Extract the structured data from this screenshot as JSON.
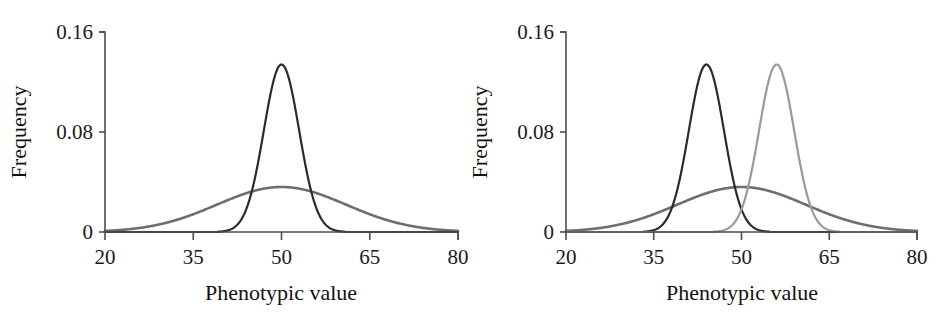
{
  "figure": {
    "background": "#ffffff",
    "panel_count": 2
  },
  "chart_data": [
    {
      "panel": "left",
      "type": "line",
      "title": "",
      "xlabel": "Phenotypic value",
      "ylabel": "Frequency",
      "xlim": [
        20,
        80
      ],
      "ylim": [
        0,
        0.16
      ],
      "xticks": [
        20,
        35,
        50,
        65,
        80
      ],
      "xticklabels": [
        "20",
        "35",
        "50",
        "65",
        "80"
      ],
      "yticks": [
        0,
        0.08,
        0.16
      ],
      "yticklabels": [
        "0",
        "0.08",
        "0.16"
      ],
      "grid": false,
      "legend": "none",
      "series": [
        {
          "name": "broad-distribution",
          "color": "#6e6e6e",
          "linewidth": 2.6,
          "shape": "gaussian",
          "mean": 50,
          "sd": 11.0,
          "peak": 0.036
        },
        {
          "name": "narrow-distribution",
          "color": "#2b2b2b",
          "linewidth": 2.2,
          "shape": "gaussian",
          "mean": 50,
          "sd": 3.0,
          "peak": 0.134
        }
      ]
    },
    {
      "panel": "right",
      "type": "line",
      "title": "",
      "xlabel": "Phenotypic value",
      "ylabel": "Frequency",
      "xlim": [
        20,
        80
      ],
      "ylim": [
        0,
        0.16
      ],
      "xticks": [
        20,
        35,
        50,
        65,
        80
      ],
      "xticklabels": [
        "20",
        "35",
        "50",
        "65",
        "80"
      ],
      "yticks": [
        0,
        0.08,
        0.16
      ],
      "yticklabels": [
        "0",
        "0.08",
        "0.16"
      ],
      "grid": false,
      "legend": "none",
      "series": [
        {
          "name": "broad-distribution",
          "color": "#6e6e6e",
          "linewidth": 2.6,
          "shape": "gaussian",
          "mean": 50,
          "sd": 11.0,
          "peak": 0.036
        },
        {
          "name": "narrow-distribution-low",
          "color": "#2b2b2b",
          "linewidth": 2.2,
          "shape": "gaussian",
          "mean": 44,
          "sd": 3.0,
          "peak": 0.134
        },
        {
          "name": "narrow-distribution-high",
          "color": "#9a9a9a",
          "linewidth": 2.2,
          "shape": "gaussian",
          "mean": 56,
          "sd": 3.0,
          "peak": 0.134
        }
      ]
    }
  ],
  "geometry": {
    "left_panel": {
      "x0": 105,
      "x1": 458,
      "y0": 232,
      "y1": 32
    },
    "right_panel": {
      "x0": 95,
      "x1": 446,
      "y0": 232,
      "y1": 32
    }
  }
}
